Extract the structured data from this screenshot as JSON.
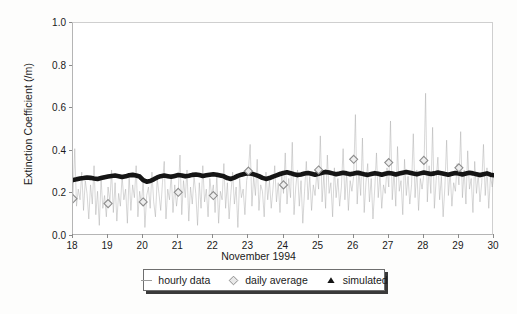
{
  "chart_data": {
    "type": "line",
    "title": "",
    "xlabel": "November 1994",
    "ylabel": "Extinction Coefficient (/m)",
    "xlim": [
      18,
      30
    ],
    "ylim": [
      0.0,
      1.0
    ],
    "grid": false,
    "legend_position": "below-axes",
    "xticks": [
      "18",
      "19",
      "20",
      "21",
      "22",
      "23",
      "24",
      "25",
      "26",
      "27",
      "28",
      "29",
      "30"
    ],
    "xtick_values": [
      18,
      19,
      20,
      21,
      22,
      23,
      24,
      25,
      26,
      27,
      28,
      29,
      30
    ],
    "yticks": [
      "0.0",
      "0.2",
      "0.4",
      "0.6",
      "0.8",
      "1.0"
    ],
    "ytick_values": [
      0.0,
      0.2,
      0.4,
      0.6,
      0.8,
      1.0
    ],
    "series": [
      {
        "name": "hourly data",
        "style": "thin-gray-line",
        "color": "#a9a9a9",
        "x": [
          18.0,
          18.05,
          18.1,
          18.15,
          18.2,
          18.25,
          18.3,
          18.35,
          18.4,
          18.45,
          18.5,
          18.55,
          18.6,
          18.65,
          18.7,
          18.75,
          18.8,
          18.85,
          18.9,
          18.95,
          19.0,
          19.05,
          19.1,
          19.15,
          19.2,
          19.25,
          19.3,
          19.35,
          19.4,
          19.45,
          19.5,
          19.55,
          19.6,
          19.65,
          19.7,
          19.75,
          19.8,
          19.85,
          19.9,
          19.95,
          20.0,
          20.05,
          20.1,
          20.15,
          20.2,
          20.25,
          20.3,
          20.35,
          20.4,
          20.45,
          20.5,
          20.55,
          20.6,
          20.65,
          20.7,
          20.75,
          20.8,
          20.85,
          20.9,
          20.95,
          21.0,
          21.05,
          21.1,
          21.15,
          21.2,
          21.25,
          21.3,
          21.35,
          21.4,
          21.45,
          21.5,
          21.55,
          21.6,
          21.65,
          21.7,
          21.75,
          21.8,
          21.85,
          21.9,
          21.95,
          22.0,
          22.05,
          22.1,
          22.15,
          22.2,
          22.25,
          22.3,
          22.35,
          22.4,
          22.45,
          22.5,
          22.55,
          22.6,
          22.65,
          22.7,
          22.75,
          22.8,
          22.85,
          22.9,
          22.95,
          23.0,
          23.05,
          23.1,
          23.15,
          23.2,
          23.25,
          23.3,
          23.35,
          23.4,
          23.45,
          23.5,
          23.55,
          23.6,
          23.65,
          23.7,
          23.75,
          23.8,
          23.85,
          23.9,
          23.95,
          24.0,
          24.05,
          24.1,
          24.15,
          24.2,
          24.25,
          24.3,
          24.35,
          24.4,
          24.45,
          24.5,
          24.55,
          24.6,
          24.65,
          24.7,
          24.75,
          24.8,
          24.85,
          24.9,
          24.95,
          25.0,
          25.05,
          25.1,
          25.15,
          25.2,
          25.25,
          25.3,
          25.35,
          25.4,
          25.45,
          25.5,
          25.55,
          25.6,
          25.65,
          25.7,
          25.75,
          25.8,
          25.85,
          25.9,
          25.95,
          26.0,
          26.05,
          26.1,
          26.15,
          26.2,
          26.25,
          26.3,
          26.35,
          26.4,
          26.45,
          26.5,
          26.55,
          26.6,
          26.65,
          26.7,
          26.75,
          26.8,
          26.85,
          26.9,
          26.95,
          27.0,
          27.05,
          27.1,
          27.15,
          27.2,
          27.25,
          27.3,
          27.35,
          27.4,
          27.45,
          27.5,
          27.55,
          27.6,
          27.65,
          27.7,
          27.75,
          27.8,
          27.85,
          27.9,
          27.95,
          28.0,
          28.05,
          28.1,
          28.15,
          28.2,
          28.25,
          28.3,
          28.35,
          28.4,
          28.45,
          28.5,
          28.55,
          28.6,
          28.65,
          28.7,
          28.75,
          28.8,
          28.85,
          28.9,
          28.95,
          29.0,
          29.05,
          29.1,
          29.15,
          29.2,
          29.25,
          29.3,
          29.35,
          29.4,
          29.45,
          29.5,
          29.55,
          29.6,
          29.65,
          29.7,
          29.75,
          29.8,
          29.85,
          29.9,
          29.95,
          30.0
        ],
        "y": [
          0.19,
          0.41,
          0.14,
          0.22,
          0.17,
          0.3,
          0.12,
          0.26,
          0.2,
          0.08,
          0.24,
          0.15,
          0.33,
          0.1,
          0.21,
          0.05,
          0.27,
          0.13,
          0.19,
          0.09,
          0.23,
          0.16,
          0.31,
          0.11,
          0.25,
          0.07,
          0.2,
          0.14,
          0.28,
          0.17,
          0.22,
          0.06,
          0.29,
          0.12,
          0.24,
          0.18,
          0.33,
          0.09,
          0.21,
          0.15,
          0.26,
          0.04,
          0.19,
          0.23,
          0.13,
          0.3,
          0.16,
          0.09,
          0.27,
          0.2,
          0.12,
          0.25,
          0.35,
          0.08,
          0.22,
          0.17,
          0.29,
          0.11,
          0.24,
          0.14,
          0.21,
          0.38,
          0.1,
          0.26,
          0.18,
          0.31,
          0.07,
          0.23,
          0.15,
          0.28,
          0.2,
          0.05,
          0.25,
          0.13,
          0.33,
          0.16,
          0.22,
          0.09,
          0.27,
          0.19,
          0.24,
          0.11,
          0.29,
          0.06,
          0.21,
          0.17,
          0.34,
          0.13,
          0.25,
          0.08,
          0.2,
          0.3,
          0.15,
          0.23,
          0.04,
          0.27,
          0.18,
          0.22,
          0.1,
          0.26,
          0.31,
          0.43,
          0.14,
          0.28,
          0.19,
          0.36,
          0.12,
          0.24,
          0.21,
          0.09,
          0.3,
          0.17,
          0.26,
          0.13,
          0.22,
          0.33,
          0.16,
          0.25,
          0.11,
          0.29,
          0.2,
          0.39,
          0.15,
          0.27,
          0.18,
          0.44,
          0.1,
          0.23,
          0.31,
          0.14,
          0.26,
          0.06,
          0.21,
          0.35,
          0.17,
          0.28,
          0.12,
          0.24,
          0.19,
          0.3,
          0.22,
          0.47,
          0.16,
          0.29,
          0.13,
          0.38,
          0.2,
          0.25,
          0.09,
          0.32,
          0.18,
          0.27,
          0.14,
          0.23,
          0.41,
          0.17,
          0.3,
          0.12,
          0.26,
          0.21,
          0.28,
          0.57,
          0.15,
          0.31,
          0.19,
          0.46,
          0.11,
          0.25,
          0.34,
          0.16,
          0.27,
          0.08,
          0.22,
          0.39,
          0.18,
          0.29,
          0.13,
          0.24,
          0.2,
          0.32,
          0.23,
          0.54,
          0.17,
          0.3,
          0.14,
          0.42,
          0.21,
          0.26,
          0.1,
          0.36,
          0.19,
          0.28,
          0.15,
          0.24,
          0.48,
          0.18,
          0.31,
          0.12,
          0.27,
          0.22,
          0.29,
          0.67,
          0.16,
          0.33,
          0.2,
          0.51,
          0.13,
          0.26,
          0.37,
          0.17,
          0.28,
          0.09,
          0.23,
          0.45,
          0.19,
          0.3,
          0.14,
          0.25,
          0.21,
          0.34,
          0.24,
          0.49,
          0.18,
          0.31,
          0.15,
          0.4,
          0.22,
          0.27,
          0.11,
          0.35,
          0.2,
          0.29,
          0.16,
          0.25,
          0.43,
          0.19,
          0.32,
          0.13,
          0.28,
          0.23,
          0.29
        ]
      },
      {
        "name": "daily average",
        "style": "open-diamond-markers",
        "color": "#8c8c8c",
        "x": [
          18.0,
          19.0,
          20.0,
          21.0,
          22.0,
          23.0,
          24.0,
          25.0,
          26.0,
          27.0,
          28.0,
          29.0
        ],
        "y": [
          0.175,
          0.152,
          0.16,
          0.205,
          0.19,
          0.305,
          0.24,
          0.31,
          0.36,
          0.345,
          0.355,
          0.32
        ]
      },
      {
        "name": "simulated",
        "style": "thick-black-line",
        "color": "#151515",
        "x": [
          18.0,
          18.1,
          18.2,
          18.3,
          18.4,
          18.5,
          18.6,
          18.7,
          18.8,
          18.9,
          19.0,
          19.1,
          19.2,
          19.3,
          19.4,
          19.5,
          19.6,
          19.7,
          19.8,
          19.9,
          20.0,
          20.1,
          20.2,
          20.3,
          20.4,
          20.5,
          20.6,
          20.7,
          20.8,
          20.9,
          21.0,
          21.1,
          21.2,
          21.3,
          21.4,
          21.5,
          21.6,
          21.7,
          21.8,
          21.9,
          22.0,
          22.1,
          22.2,
          22.3,
          22.4,
          22.5,
          22.6,
          22.7,
          22.8,
          22.9,
          23.0,
          23.1,
          23.2,
          23.3,
          23.4,
          23.5,
          23.6,
          23.7,
          23.8,
          23.9,
          24.0,
          24.1,
          24.2,
          24.3,
          24.4,
          24.5,
          24.6,
          24.7,
          24.8,
          24.9,
          25.0,
          25.1,
          25.2,
          25.3,
          25.4,
          25.5,
          25.6,
          25.7,
          25.8,
          25.9,
          26.0,
          26.1,
          26.2,
          26.3,
          26.4,
          26.5,
          26.6,
          26.7,
          26.8,
          26.9,
          27.0,
          27.1,
          27.2,
          27.3,
          27.4,
          27.5,
          27.6,
          27.7,
          27.8,
          27.9,
          28.0,
          28.1,
          28.2,
          28.3,
          28.4,
          28.5,
          28.6,
          28.7,
          28.8,
          28.9,
          29.0,
          29.1,
          29.2,
          29.3,
          29.4,
          29.5,
          29.6,
          29.7,
          29.8,
          29.9,
          30.0
        ],
        "y": [
          0.263,
          0.266,
          0.27,
          0.272,
          0.275,
          0.273,
          0.27,
          0.268,
          0.272,
          0.276,
          0.279,
          0.282,
          0.284,
          0.281,
          0.277,
          0.28,
          0.285,
          0.287,
          0.284,
          0.279,
          0.262,
          0.255,
          0.258,
          0.266,
          0.275,
          0.281,
          0.284,
          0.281,
          0.278,
          0.282,
          0.286,
          0.284,
          0.28,
          0.283,
          0.287,
          0.289,
          0.286,
          0.282,
          0.285,
          0.288,
          0.29,
          0.288,
          0.284,
          0.28,
          0.272,
          0.268,
          0.274,
          0.282,
          0.288,
          0.292,
          0.295,
          0.292,
          0.287,
          0.281,
          0.273,
          0.268,
          0.272,
          0.279,
          0.285,
          0.291,
          0.296,
          0.299,
          0.295,
          0.29,
          0.286,
          0.289,
          0.293,
          0.296,
          0.292,
          0.288,
          0.292,
          0.297,
          0.301,
          0.298,
          0.294,
          0.29,
          0.293,
          0.297,
          0.294,
          0.29,
          0.293,
          0.297,
          0.294,
          0.29,
          0.287,
          0.291,
          0.295,
          0.292,
          0.288,
          0.292,
          0.296,
          0.293,
          0.289,
          0.293,
          0.297,
          0.3,
          0.297,
          0.293,
          0.29,
          0.294,
          0.298,
          0.295,
          0.291,
          0.294,
          0.298,
          0.295,
          0.291,
          0.288,
          0.292,
          0.296,
          0.293,
          0.289,
          0.293,
          0.297,
          0.294,
          0.29,
          0.286,
          0.29,
          0.294,
          0.288,
          0.285
        ]
      }
    ]
  },
  "axes": {
    "ylabel": "Extinction Coefficient (/m)",
    "xlabel": "November 1994",
    "ytick_labels": [
      "1.0",
      "0.8",
      "0.6",
      "0.4",
      "0.2",
      "0.0"
    ],
    "xtick_labels": [
      "18",
      "19",
      "20",
      "21",
      "22",
      "23",
      "24",
      "25",
      "26",
      "27",
      "28",
      "29",
      "30"
    ]
  },
  "legend": {
    "entries": [
      {
        "label": "hourly data",
        "marker": "line-swatch",
        "color": "#9b9b9b"
      },
      {
        "label": "daily average",
        "marker": "diamond-swatch",
        "color": "#8c8c8c"
      },
      {
        "label": "simulated",
        "marker": "triangle-swatch",
        "color": "#151515"
      }
    ]
  },
  "colors": {
    "hourly": "#a9a9a9",
    "daily_average": "#8c8c8c",
    "simulated": "#151515",
    "axis": "#b5b5b5",
    "text": "#1a1a1a",
    "background": "#fdfdfc"
  }
}
